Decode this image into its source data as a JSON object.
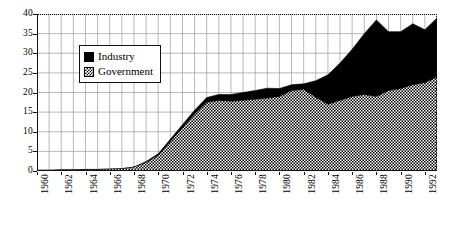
{
  "chart_data": {
    "type": "area",
    "stacked": true,
    "title": "",
    "subtitle": "",
    "xlabel": "",
    "ylabel": "",
    "xlim": [
      1960,
      1993
    ],
    "ylim": [
      0,
      40
    ],
    "yticks": [
      0,
      5,
      10,
      15,
      20,
      25,
      30,
      35,
      40
    ],
    "grid": true,
    "grid_x_step": 1,
    "legend_position": "top-left",
    "x": [
      1960,
      1961,
      1962,
      1963,
      1964,
      1965,
      1966,
      1967,
      1968,
      1969,
      1970,
      1971,
      1972,
      1973,
      1974,
      1975,
      1976,
      1977,
      1978,
      1979,
      1980,
      1981,
      1982,
      1983,
      1984,
      1985,
      1986,
      1987,
      1988,
      1989,
      1990,
      1991,
      1992,
      1993
    ],
    "xtick_labels": [
      "1960",
      "1962",
      "1964",
      "1966",
      "1968",
      "1970",
      "1972",
      "1974",
      "1976",
      "1978",
      "1980",
      "1982",
      "1984",
      "1986",
      "1988",
      "1990",
      "1992"
    ],
    "series": [
      {
        "name": "Government",
        "fill": "checkered",
        "values": [
          0.2,
          0.2,
          0.3,
          0.3,
          0.4,
          0.4,
          0.5,
          0.6,
          1.0,
          2.2,
          4.0,
          7.5,
          11.0,
          14.5,
          17.5,
          18.0,
          17.8,
          18.0,
          18.3,
          18.6,
          19.0,
          20.5,
          20.8,
          18.8,
          17.0,
          18.0,
          19.0,
          19.5,
          19.0,
          20.5,
          21.0,
          22.0,
          22.5,
          24.0
        ]
      },
      {
        "name": "Industry",
        "fill": "solid-black",
        "values": [
          0.0,
          0.0,
          0.0,
          0.0,
          0.0,
          0.0,
          0.0,
          0.0,
          0.0,
          0.2,
          0.4,
          0.6,
          0.8,
          1.0,
          1.2,
          1.5,
          1.7,
          2.0,
          2.2,
          2.5,
          2.0,
          1.5,
          1.4,
          4.2,
          7.5,
          9.5,
          12.0,
          15.5,
          19.5,
          15.0,
          14.5,
          15.5,
          13.5,
          15.0
        ]
      }
    ],
    "totals": [
      0.2,
      0.2,
      0.3,
      0.3,
      0.4,
      0.4,
      0.5,
      0.6,
      1.0,
      2.4,
      4.4,
      8.1,
      11.8,
      15.5,
      18.7,
      19.5,
      19.5,
      20.0,
      20.5,
      21.1,
      21.0,
      22.0,
      22.2,
      23.0,
      24.5,
      27.5,
      31.0,
      35.0,
      38.5,
      35.5,
      35.5,
      37.5,
      36.0,
      39.0
    ]
  },
  "legend": {
    "items": [
      {
        "label": "Industry",
        "swatch": "solid-black-swatch"
      },
      {
        "label": "Government",
        "swatch": "checkered-swatch"
      }
    ]
  },
  "colors": {
    "axis": "#111111",
    "grid": "#9a9a9a",
    "industry": "#000000",
    "government_ink": "#000000",
    "background": "#ffffff"
  }
}
